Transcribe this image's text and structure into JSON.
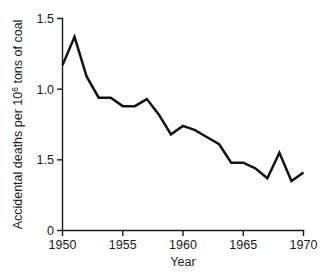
{
  "chart_data": {
    "type": "line",
    "title": "",
    "xlabel": "Year",
    "ylabel": "Accidental deaths per 10",
    "ylabel_superscript": "6",
    "ylabel_suffix": " tons of coal",
    "ylabel_full": "Accidental deaths per 10^6 tons of coal",
    "xlim": [
      1950,
      1970
    ],
    "ylim": [
      0,
      1.5
    ],
    "xticks": [
      1950,
      1955,
      1960,
      1965,
      1970
    ],
    "xtick_labels": [
      "1950",
      "1955",
      "1960",
      "1965",
      "1970"
    ],
    "yticks": [
      0,
      0.5,
      1.0,
      1.5
    ],
    "ytick_labels": [
      "0",
      "1.5",
      "1.0",
      "1.5"
    ],
    "grid": false,
    "legend": false,
    "line_color": "#141414",
    "background_color": "#ffffff",
    "x": [
      1950,
      1951,
      1952,
      1953,
      1954,
      1955,
      1956,
      1957,
      1958,
      1959,
      1960,
      1961,
      1962,
      1963,
      1964,
      1965,
      1966,
      1967,
      1968,
      1969,
      1970
    ],
    "values": [
      1.17,
      1.37,
      1.09,
      0.94,
      0.94,
      0.88,
      0.88,
      0.93,
      0.82,
      0.68,
      0.74,
      0.71,
      0.66,
      0.61,
      0.48,
      0.48,
      0.44,
      0.37,
      0.55,
      0.35,
      0.41
    ],
    "series": [
      {
        "name": "Accidental deaths per 10^6 tons of coal",
        "values": [
          1.17,
          1.37,
          1.09,
          0.94,
          0.94,
          0.88,
          0.88,
          0.93,
          0.82,
          0.68,
          0.74,
          0.71,
          0.66,
          0.61,
          0.48,
          0.48,
          0.44,
          0.37,
          0.55,
          0.35,
          0.41
        ]
      }
    ]
  }
}
